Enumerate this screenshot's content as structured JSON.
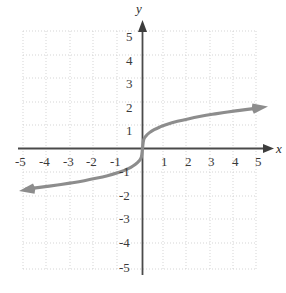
{
  "chart_data": {
    "type": "line",
    "title": "",
    "xlabel": "x",
    "ylabel": "y",
    "xlim": [
      -5,
      5
    ],
    "ylim": [
      -5,
      5
    ],
    "grid": true,
    "grid_style": "dotted",
    "legend": "none",
    "x_ticks": [
      "-5",
      "-4",
      "-3",
      "-2",
      "-1",
      "1",
      "2",
      "3",
      "4",
      "5"
    ],
    "y_ticks": [
      "5",
      "4",
      "3",
      "2",
      "1",
      "-1",
      "-2",
      "-3",
      "-4",
      "-5"
    ],
    "series": [
      {
        "name": "cube-root-curve",
        "color": "#8d8d8d",
        "arrow_start": true,
        "arrow_end": true,
        "x": [
          -5.0,
          -4.5,
          -4.0,
          -3.5,
          -3.0,
          -2.5,
          -2.0,
          -1.5,
          -1.0,
          -0.75,
          -0.5,
          -0.3,
          -0.15,
          -0.05,
          0.0,
          0.05,
          0.15,
          0.3,
          0.5,
          0.75,
          1.0,
          1.5,
          2.0,
          2.5,
          3.0,
          3.5,
          4.0,
          4.5,
          5.0
        ],
        "y": [
          -1.71,
          -1.65,
          -1.587,
          -1.518,
          -1.442,
          -1.357,
          -1.26,
          -1.145,
          -1.0,
          -0.909,
          -0.794,
          -0.669,
          -0.531,
          -0.368,
          0.0,
          0.368,
          0.531,
          0.669,
          0.794,
          0.909,
          1.0,
          1.145,
          1.26,
          1.357,
          1.442,
          1.518,
          1.587,
          1.65,
          1.71
        ]
      }
    ]
  },
  "axes": {
    "x_axis_label": "x",
    "y_axis_label": "y"
  },
  "colors": {
    "curve": "#8d8d8d",
    "axis": "#4a4a4a",
    "grid": "#cfcfcf",
    "text": "#3a3a3a"
  }
}
